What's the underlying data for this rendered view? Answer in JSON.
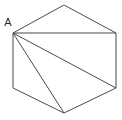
{
  "figure": {
    "type": "geometry-diagram",
    "shape_name": "hexagon",
    "background_color": "#ffffff",
    "stroke_color": "#4a4a4a",
    "label_color": "#2b2b2b",
    "canvas": {
      "width": 122,
      "height": 120
    },
    "vertices": [
      {
        "id": "A",
        "label": "A",
        "x": 13,
        "y": 33,
        "label_x": 8,
        "label_y": 26
      },
      {
        "id": "B",
        "label": "",
        "x": 64,
        "y": 5,
        "label_x": 0,
        "label_y": 0
      },
      {
        "id": "C",
        "label": "",
        "x": 116,
        "y": 33,
        "label_x": 0,
        "label_y": 0
      },
      {
        "id": "D",
        "label": "",
        "x": 116,
        "y": 88,
        "label_x": 0,
        "label_y": 0
      },
      {
        "id": "E",
        "label": "",
        "x": 64,
        "y": 113,
        "label_x": 0,
        "label_y": 0
      },
      {
        "id": "F",
        "label": "",
        "x": 13,
        "y": 88,
        "label_x": 0,
        "label_y": 0
      }
    ],
    "outline_points": "13,33 64,5 116,33 116,88 64,113 13,88",
    "diagonals": [
      {
        "id": "A-C",
        "from": "A",
        "x1": 13,
        "y1": 33,
        "x2": 116,
        "y2": 33
      },
      {
        "id": "A-D",
        "from": "A",
        "x1": 13,
        "y1": 33,
        "x2": 116,
        "y2": 88
      },
      {
        "id": "A-E",
        "from": "A",
        "x1": 13,
        "y1": 33,
        "x2": 64,
        "y2": 113
      }
    ],
    "labels": [
      {
        "id": "vertex-a",
        "text": "A",
        "x": 8,
        "y": 26
      }
    ]
  }
}
